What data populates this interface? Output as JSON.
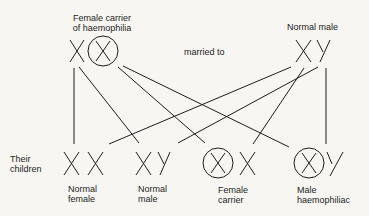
{
  "parents": {
    "mother": {
      "label_line1": "Female carrier",
      "label_line2": "of haemophilia",
      "genotype": "X X(circled)"
    },
    "relation": "married to",
    "father": {
      "label": "Normal male",
      "genotype": "XY"
    }
  },
  "children_label_line1": "Their",
  "children_label_line2": "children",
  "children": [
    {
      "label_line1": "Normal",
      "label_line2": "female",
      "genotype": "XX"
    },
    {
      "label_line1": "Normal",
      "label_line2": "male",
      "genotype": "XY"
    },
    {
      "label_line1": "Female",
      "label_line2": "carrier",
      "genotype": "X(circled) X"
    },
    {
      "label_line1": "Male",
      "label_line2": "haemophiliac",
      "genotype": "X(circled) Y"
    }
  ]
}
